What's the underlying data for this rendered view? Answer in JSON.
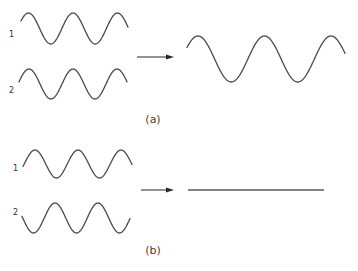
{
  "panels": [
    {
      "id": "a",
      "caption": "(a)",
      "caption_pos": [
        153,
        114
      ],
      "inputs": [
        {
          "label": "1",
          "label_pos": [
            9,
            31
          ],
          "wave": {
            "x0": 21,
            "x1": 128,
            "cy": 28.5,
            "amp": 15.5,
            "period": 44.5,
            "peak_x": 28.5
          }
        },
        {
          "label": "2",
          "label_pos": [
            9,
            87
          ],
          "wave": {
            "x0": 19,
            "x1": 127,
            "cy": 84,
            "amp": 15,
            "period": 44,
            "peak_x": 29
          }
        }
      ],
      "arrow": {
        "x1": 137,
        "x2": 174,
        "y": 57
      },
      "result": {
        "type": "wave",
        "label": "constructive interference",
        "wave": {
          "x0": 187,
          "x1": 345,
          "cy": 59,
          "amp": 23,
          "period": 66.5,
          "peak_x": 198
        }
      }
    },
    {
      "id": "b",
      "caption": "(b)",
      "caption_pos": [
        153,
        245
      ],
      "inputs": [
        {
          "label": "1",
          "label_pos": [
            13,
            165
          ],
          "wave": {
            "x0": 23,
            "x1": 132,
            "cy": 164,
            "amp": 14,
            "period": 43,
            "peak_x": 35
          }
        },
        {
          "label": "2",
          "label_pos": [
            13,
            209
          ],
          "wave": {
            "x0": 22,
            "x1": 130,
            "cy": 218,
            "amp": 15,
            "period": 43,
            "peak_x": 55
          }
        }
      ],
      "arrow": {
        "x1": 141,
        "x2": 174,
        "y": 190
      },
      "result": {
        "type": "flat",
        "label": "destructive interference",
        "line": {
          "x1": 188,
          "x2": 324,
          "y": 190
        }
      }
    }
  ],
  "colors": {
    "stroke": "#4a4a4a",
    "arrow": "#2a2a2a",
    "background": "#ffffff"
  }
}
